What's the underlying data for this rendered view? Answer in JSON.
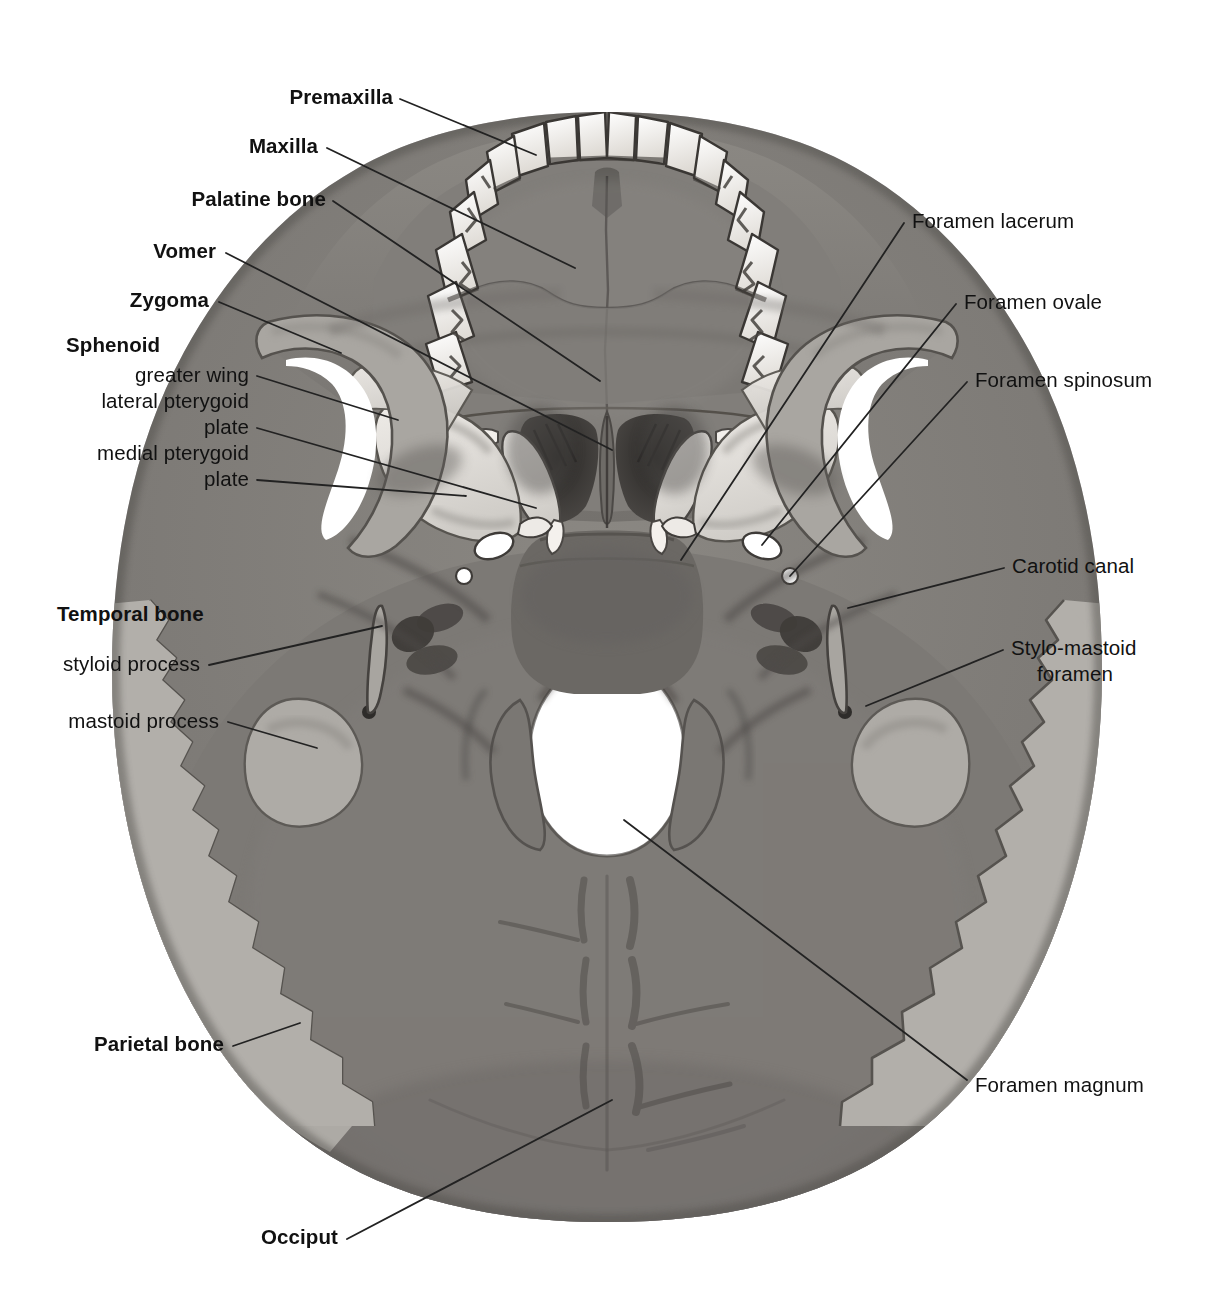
{
  "figure": {
    "view": "basal / inferior aspect",
    "style": "grayscale anatomical engraving with leader lines"
  },
  "palette": {
    "background": "#ffffff",
    "ink": "#111111",
    "leader_line": "#222222",
    "bone_light": "#f2f0ed",
    "bone_pale": "#d9d6d1",
    "bone_mid": "#9a9792",
    "bone_dark": "#6f6c68",
    "bone_darker": "#55524f",
    "shadow": "#3a3836",
    "foramen_white": "#ffffff"
  },
  "labels_left": [
    {
      "id": "premaxilla",
      "text": "Premaxilla",
      "bold": true,
      "x": 393,
      "y": 84,
      "align": "right",
      "leader": [
        [
          400,
          99
        ],
        [
          536,
          155
        ]
      ]
    },
    {
      "id": "maxilla",
      "text": "Maxilla",
      "bold": true,
      "x": 318,
      "y": 133,
      "align": "right",
      "leader": [
        [
          327,
          148
        ],
        [
          575,
          268
        ]
      ]
    },
    {
      "id": "palatine-bone",
      "text": "Palatine bone",
      "bold": true,
      "x": 326,
      "y": 186,
      "align": "right",
      "leader": [
        [
          333,
          201
        ],
        [
          600,
          381
        ]
      ]
    },
    {
      "id": "vomer",
      "text": "Vomer",
      "bold": true,
      "x": 216,
      "y": 238,
      "align": "right",
      "leader": [
        [
          226,
          253
        ],
        [
          612,
          450
        ]
      ]
    },
    {
      "id": "zygoma",
      "text": "Zygoma",
      "bold": true,
      "x": 209,
      "y": 287,
      "align": "right",
      "leader": [
        [
          219,
          302
        ],
        [
          341,
          353
        ]
      ]
    },
    {
      "id": "sphenoid-head",
      "text": "Sphenoid",
      "bold": true,
      "x": 190,
      "y": 332,
      "align": "right",
      "leader": null
    },
    {
      "id": "greater-wing",
      "text": "greater wing",
      "bold": false,
      "x": 249,
      "y": 362,
      "align": "right",
      "leader": [
        [
          257,
          376
        ],
        [
          398,
          420
        ]
      ]
    },
    {
      "id": "lateral-pterygoid",
      "text": "lateral pterygoid",
      "bold": false,
      "x": 249,
      "y": 388,
      "align": "right",
      "leader": null
    },
    {
      "id": "lateral-plate",
      "text": "plate",
      "bold": false,
      "x": 249,
      "y": 414,
      "align": "right",
      "leader": [
        [
          257,
          428
        ],
        [
          536,
          508
        ]
      ]
    },
    {
      "id": "medial-pterygoid",
      "text": "medial pterygoid",
      "bold": false,
      "x": 249,
      "y": 440,
      "align": "right",
      "leader": null
    },
    {
      "id": "medial-plate",
      "text": "plate",
      "bold": false,
      "x": 249,
      "y": 466,
      "align": "right",
      "leader": [
        [
          257,
          480
        ],
        [
          466,
          496
        ]
      ]
    },
    {
      "id": "temporal-bone",
      "text": "Temporal bone",
      "bold": true,
      "x": 228,
      "y": 601,
      "align": "right",
      "leader": null
    },
    {
      "id": "styloid-process",
      "text": "styloid process",
      "bold": false,
      "x": 200,
      "y": 651,
      "align": "right",
      "leader": [
        [
          209,
          665
        ],
        [
          382,
          626
        ]
      ]
    },
    {
      "id": "mastoid-process",
      "text": "mastoid process",
      "bold": false,
      "x": 219,
      "y": 708,
      "align": "right",
      "leader": [
        [
          228,
          722
        ],
        [
          317,
          748
        ]
      ]
    },
    {
      "id": "parietal-bone",
      "text": "Parietal bone",
      "bold": true,
      "x": 224,
      "y": 1031,
      "align": "right",
      "leader": [
        [
          233,
          1046
        ],
        [
          300,
          1023
        ]
      ]
    },
    {
      "id": "occiput",
      "text": "Occiput",
      "bold": true,
      "x": 338,
      "y": 1224,
      "align": "right",
      "leader": [
        [
          347,
          1239
        ],
        [
          612,
          1100
        ]
      ]
    }
  ],
  "labels_right": [
    {
      "id": "foramen-lacerum",
      "text": "Foramen lacerum",
      "bold": false,
      "x": 912,
      "y": 208,
      "align": "left",
      "leader": [
        [
          904,
          223
        ],
        [
          681,
          560
        ]
      ]
    },
    {
      "id": "foramen-ovale",
      "text": "Foramen ovale",
      "bold": false,
      "x": 964,
      "y": 289,
      "align": "left",
      "leader": [
        [
          956,
          304
        ],
        [
          762,
          545
        ]
      ]
    },
    {
      "id": "foramen-spinosum",
      "text": "Foramen spinosum",
      "bold": false,
      "x": 975,
      "y": 367,
      "align": "left",
      "leader": [
        [
          967,
          382
        ],
        [
          790,
          576
        ]
      ]
    },
    {
      "id": "carotid-canal",
      "text": "Carotid canal",
      "bold": false,
      "x": 1012,
      "y": 553,
      "align": "left",
      "leader": [
        [
          1004,
          568
        ],
        [
          848,
          608
        ]
      ]
    },
    {
      "id": "stylo-mastoid-1",
      "text": "Stylo-mastoid",
      "bold": false,
      "x": 1011,
      "y": 635,
      "align": "left",
      "leader": [
        [
          1003,
          650
        ],
        [
          866,
          706
        ]
      ]
    },
    {
      "id": "stylo-mastoid-2",
      "text": "foramen",
      "bold": false,
      "x": 1037,
      "y": 661,
      "align": "left",
      "leader": null
    },
    {
      "id": "foramen-magnum",
      "text": "Foramen magnum",
      "bold": false,
      "x": 975,
      "y": 1072,
      "align": "left",
      "leader": [
        [
          967,
          1080
        ],
        [
          624,
          820
        ]
      ]
    }
  ],
  "anatomy_features": [
    {
      "name": "upper-teeth-arch",
      "kind": "teeth",
      "count": 16
    },
    {
      "name": "hard-palate",
      "kind": "bone-plate"
    },
    {
      "name": "median-palatine-suture",
      "kind": "suture"
    },
    {
      "name": "choanae",
      "kind": "opening",
      "count": 2
    },
    {
      "name": "vomer-ridge",
      "kind": "ridge"
    },
    {
      "name": "pterygoid-plates",
      "kind": "plate",
      "count": 4
    },
    {
      "name": "zygomatic-arch",
      "kind": "arch",
      "count": 2
    },
    {
      "name": "foramen-ovale",
      "kind": "foramen",
      "count": 2
    },
    {
      "name": "foramen-spinosum",
      "kind": "foramen",
      "count": 2
    },
    {
      "name": "foramen-lacerum",
      "kind": "foramen",
      "count": 2
    },
    {
      "name": "carotid-canal",
      "kind": "foramen",
      "count": 2
    },
    {
      "name": "styloid-process",
      "kind": "process",
      "count": 2
    },
    {
      "name": "stylomastoid-foramen",
      "kind": "foramen",
      "count": 2
    },
    {
      "name": "mastoid-process",
      "kind": "process",
      "count": 2
    },
    {
      "name": "jugular-foramen",
      "kind": "foramen",
      "count": 2
    },
    {
      "name": "occipital-condyles",
      "kind": "condyle",
      "count": 2
    },
    {
      "name": "foramen-magnum",
      "kind": "opening"
    },
    {
      "name": "nuchal-lines",
      "kind": "ridge"
    },
    {
      "name": "lambdoid-suture",
      "kind": "suture"
    },
    {
      "name": "parietal-bone",
      "kind": "bone",
      "count": 2
    },
    {
      "name": "occipital-bone",
      "kind": "bone"
    }
  ]
}
